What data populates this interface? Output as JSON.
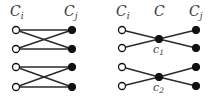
{
  "left_graph": {
    "header_left": "C",
    "header_left_sub": "i",
    "header_right": "C",
    "header_right_sub": "j",
    "rows_y": [
      30,
      49,
      67,
      87
    ],
    "left_x": 16,
    "right_x": 72,
    "edges": [
      [
        0,
        0
      ],
      [
        0,
        1
      ],
      [
        1,
        0
      ],
      [
        1,
        1
      ],
      [
        2,
        2
      ],
      [
        2,
        3
      ],
      [
        3,
        2
      ],
      [
        3,
        3
      ]
    ]
  },
  "right_graph": {
    "header_left": "C",
    "header_left_sub": "i",
    "header_middle": "C",
    "header_right": "C",
    "header_right_sub": "j",
    "left_x": 122,
    "mid_x": 159,
    "right_x": 196,
    "centers": [
      {
        "label": "c",
        "sub": "1",
        "y": 39,
        "rows_y": [
          30,
          48
        ]
      },
      {
        "label": "c",
        "sub": "2",
        "y": 77,
        "rows_y": [
          67,
          86
        ]
      }
    ]
  },
  "colors": {
    "edge": "#2a2a2a",
    "node": "#111111",
    "label": "#3a3a3a"
  }
}
